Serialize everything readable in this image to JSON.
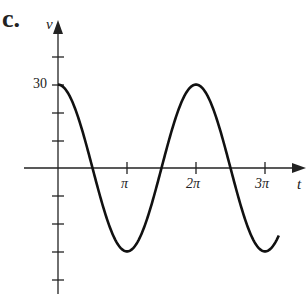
{
  "label": "c.",
  "chart_data": {
    "type": "line",
    "title": "",
    "xlabel": "t",
    "ylabel": "v",
    "x_ticks": [
      "π",
      "2π",
      "3π"
    ],
    "y_tick_labels": [
      "30"
    ],
    "y_ticks": [
      40,
      30,
      20,
      10,
      -10,
      -20,
      -30,
      -40
    ],
    "function": "v = 30 cos(t)",
    "xlim": [
      0,
      3.25
    ],
    "xlim_units": "π",
    "ylim": [
      -45,
      45
    ],
    "series": [
      {
        "name": "v(t)",
        "x": [
          "0",
          "π/2",
          "π",
          "3π/2",
          "2π",
          "5π/2",
          "3π",
          "3.2π"
        ],
        "values": [
          30,
          0,
          -30,
          0,
          30,
          0,
          -30,
          -24
        ]
      }
    ],
    "grid": false
  }
}
